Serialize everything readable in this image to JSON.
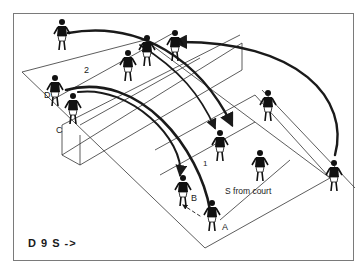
{
  "diagram": {
    "caption": "D 9 S ->",
    "annotation": "S from court",
    "player_labels": [
      "A",
      "B",
      "C",
      "D"
    ],
    "path_numbers": [
      "1",
      "2"
    ],
    "colors": {
      "line": "#1a1a1a",
      "court_line": "#333333",
      "frame": "#7a7a7a",
      "background": "#ffffff"
    }
  }
}
